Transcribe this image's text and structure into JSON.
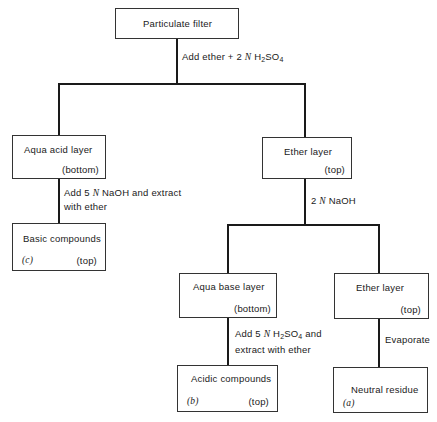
{
  "diagram": {
    "nodes": {
      "particulate_filter": {
        "label": "Particulate filter"
      },
      "aqua_acid_layer": {
        "label": "Aqua acid layer",
        "position": "(bottom)"
      },
      "ether_layer_1": {
        "label": "Ether layer",
        "position": "(top)"
      },
      "basic_compounds": {
        "label": "Basic compounds",
        "tag": "(c)",
        "position": "(top)"
      },
      "aqua_base_layer": {
        "label": "Aqua base layer",
        "position": "(bottom)"
      },
      "ether_layer_2": {
        "label": "Ether layer",
        "position": "(top)"
      },
      "acidic_compounds": {
        "label": "Acidic compounds",
        "tag": "(b)",
        "position": "(top)"
      },
      "neutral_residue": {
        "label": "Neutral residue",
        "tag": "(a)"
      }
    },
    "edges": {
      "step1": {
        "pre": "Add ether + 2 ",
        "n": "N",
        "reagent": " H",
        "sub1": "2",
        "mid": "SO",
        "sub2": "4"
      },
      "step2": {
        "pre": "2 ",
        "n": "N",
        "post": " NaOH"
      },
      "step3": {
        "line1_pre": "Add 5 ",
        "n": "N",
        "line1_post": " NaOH and extract",
        "line2": "with ether"
      },
      "step4": {
        "line1_pre": "Add 5 ",
        "n": "N",
        "reagent": " H",
        "sub1": "2",
        "mid": "SO",
        "sub2": "4",
        "line1_post": " and",
        "line2": "extract with ether"
      },
      "step5": {
        "label": "Evaporate"
      }
    }
  }
}
